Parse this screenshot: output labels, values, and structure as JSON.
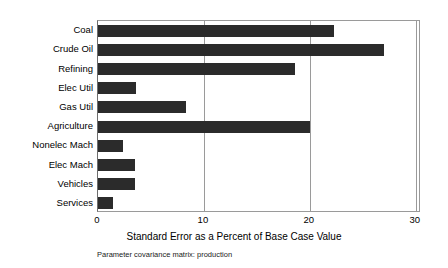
{
  "chart_data": {
    "type": "bar",
    "orientation": "horizontal",
    "title": "",
    "subtitle": "",
    "xlabel": "Standard Error as a Percent of Base Case Value",
    "ylabel": "",
    "caption": "Parameter covariance matrix: production",
    "categories": [
      "Coal",
      "Crude Oil",
      "Refining",
      "Elec Util",
      "Gas Util",
      "Agriculture",
      "Nonelec Mach",
      "Elec Mach",
      "Vehicles",
      "Services"
    ],
    "values": [
      22.3,
      27.0,
      18.6,
      3.6,
      8.3,
      20.0,
      2.4,
      3.5,
      3.5,
      1.4
    ],
    "xlim": [
      0,
      30.5
    ],
    "xticks": [
      0,
      10,
      20,
      30
    ],
    "xtick_labels": [
      "0",
      "10",
      "20",
      "30"
    ],
    "grid": "vertical",
    "legend": "none",
    "bar_color": "#2b2b2b",
    "axis_color": "#9a9a9a",
    "background_color": "#ffffff"
  }
}
